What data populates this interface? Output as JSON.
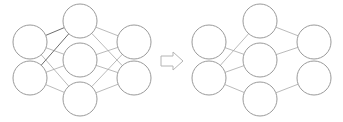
{
  "figure": {
    "background_color": "#ffffff",
    "width": 343,
    "height": 122,
    "node_fill": "#ffffff",
    "node_stroke": "#9a9a9a",
    "edge_color": "#a8a8a8",
    "edge_emphasis_color": "#6e6e6e",
    "arrow_stroke": "#b4b4b4",
    "arrow_fill": "#ffffff",
    "node_radius": 17,
    "hidden_node_radius": 17
  },
  "left_network": {
    "label": "standard-neural-net",
    "layers": [
      {
        "name": "input-layer",
        "cx": 30,
        "nodes": [
          {
            "id": "L-in-1",
            "cx": 30,
            "cy": 42,
            "r": 17
          },
          {
            "id": "L-in-2",
            "cx": 30,
            "cy": 78,
            "r": 17
          }
        ]
      },
      {
        "name": "hidden-layer",
        "cx": 80,
        "nodes": [
          {
            "id": "L-h-1",
            "cx": 80,
            "cy": 21,
            "r": 17
          },
          {
            "id": "L-h-2",
            "cx": 80,
            "cy": 60,
            "r": 17
          },
          {
            "id": "L-h-3",
            "cx": 80,
            "cy": 99,
            "r": 17
          }
        ]
      },
      {
        "name": "output-layer",
        "cx": 134,
        "nodes": [
          {
            "id": "L-out-1",
            "cx": 134,
            "cy": 42,
            "r": 17
          },
          {
            "id": "L-out-2",
            "cx": 134,
            "cy": 78,
            "r": 17
          }
        ]
      }
    ],
    "edges": [
      {
        "from": "L-in-1",
        "to": "L-h-1",
        "emphasis": true
      },
      {
        "from": "L-in-1",
        "to": "L-h-2",
        "emphasis": false
      },
      {
        "from": "L-in-1",
        "to": "L-h-3",
        "emphasis": false
      },
      {
        "from": "L-in-2",
        "to": "L-h-1",
        "emphasis": true
      },
      {
        "from": "L-in-2",
        "to": "L-h-2",
        "emphasis": false
      },
      {
        "from": "L-in-2",
        "to": "L-h-3",
        "emphasis": false
      },
      {
        "from": "L-h-1",
        "to": "L-out-1",
        "emphasis": false
      },
      {
        "from": "L-h-1",
        "to": "L-out-2",
        "emphasis": false
      },
      {
        "from": "L-h-2",
        "to": "L-out-1",
        "emphasis": false
      },
      {
        "from": "L-h-2",
        "to": "L-out-2",
        "emphasis": false
      },
      {
        "from": "L-h-3",
        "to": "L-out-1",
        "emphasis": false
      },
      {
        "from": "L-h-3",
        "to": "L-out-2",
        "emphasis": false
      }
    ],
    "edge_count": 12
  },
  "arrow": {
    "name": "right-arrow-icon",
    "cx": 172,
    "cy": 61,
    "points": "161,56 173,56 173,52 183,61 173,70 173,66 161,66"
  },
  "right_network": {
    "label": "after-applying-dropout",
    "layers": [
      {
        "name": "input-layer",
        "cx": 209,
        "nodes": [
          {
            "id": "R-in-1",
            "cx": 209,
            "cy": 42,
            "r": 17
          },
          {
            "id": "R-in-2",
            "cx": 209,
            "cy": 78,
            "r": 17
          }
        ]
      },
      {
        "name": "hidden-layer",
        "cx": 260,
        "nodes": [
          {
            "id": "R-h-1",
            "cx": 260,
            "cy": 21,
            "r": 17
          },
          {
            "id": "R-h-2",
            "cx": 260,
            "cy": 60,
            "r": 17
          },
          {
            "id": "R-h-3",
            "cx": 260,
            "cy": 99,
            "r": 17
          }
        ]
      },
      {
        "name": "output-layer",
        "cx": 314,
        "nodes": [
          {
            "id": "R-out-1",
            "cx": 314,
            "cy": 42,
            "r": 17
          },
          {
            "id": "R-out-2",
            "cx": 314,
            "cy": 78,
            "r": 17
          }
        ]
      }
    ],
    "edges": [
      {
        "from": "R-in-1",
        "to": "R-h-2",
        "emphasis": false
      },
      {
        "from": "R-in-2",
        "to": "R-h-1",
        "emphasis": false
      },
      {
        "from": "R-in-2",
        "to": "R-h-2",
        "emphasis": false
      },
      {
        "from": "R-in-2",
        "to": "R-h-3",
        "emphasis": false
      },
      {
        "from": "R-h-1",
        "to": "R-out-1",
        "emphasis": false
      },
      {
        "from": "R-h-2",
        "to": "R-out-1",
        "emphasis": false
      },
      {
        "from": "R-h-3",
        "to": "R-out-2",
        "emphasis": false
      }
    ],
    "edge_count": 7
  }
}
